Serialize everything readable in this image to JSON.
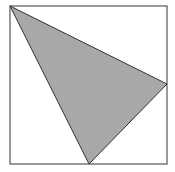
{
  "diagram": {
    "type": "geometry",
    "square": {
      "x": 10,
      "y": 6,
      "width": 157,
      "height": 158,
      "stroke": "#555555",
      "fill": "#ffffff"
    },
    "triangle": {
      "vertices": [
        [
          10,
          6
        ],
        [
          167,
          84
        ],
        [
          89,
          164
        ]
      ],
      "fill": "#a8a8a8",
      "stroke": "#333333"
    }
  }
}
